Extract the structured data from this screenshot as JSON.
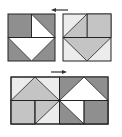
{
  "diagram": {
    "type": "tile-rotation-puzzle",
    "colors": {
      "dark": "#8f8f8f",
      "light": "#c4c4c4",
      "pale": "#ececec",
      "white": "#ffffff",
      "stroke": "#222222"
    },
    "top_left_square": {
      "label": "original tile"
    },
    "top_right_square": {
      "label": "transformed tile"
    },
    "top_arrow": {
      "direction": "left"
    },
    "bottom_arrow": {
      "direction": "right"
    },
    "bottom_rect": {
      "label": "combined tiles"
    }
  }
}
